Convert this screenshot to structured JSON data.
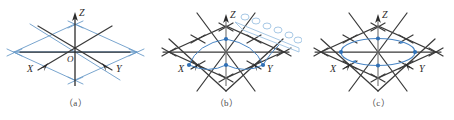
{
  "figure": {
    "type": "three-panel-geometry-diagram",
    "background": "#ffffff",
    "panels": [
      {
        "id": "a",
        "caption": "（a）",
        "description": "isometric X-Y-Z axes over a light-blue rhombic lattice"
      },
      {
        "id": "b",
        "caption": "（b）",
        "description": "lattice with blue midpoint nodes, connecting arcs and a helical chain of circles at upper right"
      },
      {
        "id": "c",
        "caption": "（c）",
        "description": "lattice with a blue ellipse passing through four blue nodes"
      }
    ],
    "axes": {
      "x_label": "X",
      "y_label": "Y",
      "z_label": "Z",
      "origin_label": "O"
    },
    "colors": {
      "axis_black": "#2b2b2b",
      "lattice_black": "#3a3a3a",
      "lattice_blue": "#6a9bc8",
      "node_blue": "#2f6fb5",
      "curve_blue": "#4a86c5",
      "caption_gray": "#4a4a4a",
      "background": "#ffffff"
    },
    "nodes": {
      "panel_b_count": 4,
      "panel_c_count": 4,
      "helix_circle_count": 6
    }
  }
}
